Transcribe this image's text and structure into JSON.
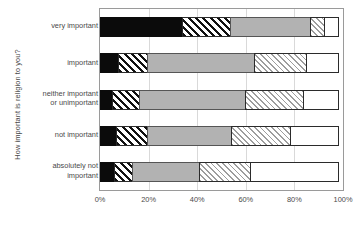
{
  "chart_data": {
    "type": "bar",
    "orientation": "horizontal",
    "stacked": "100%",
    "title": "",
    "xlabel": "",
    "ylabel": "How important is religion to you?",
    "xlim": [
      0,
      100
    ],
    "grid": true,
    "legend": "none",
    "xticks": [
      "0%",
      "20%",
      "40%",
      "60%",
      "80%",
      "100%"
    ],
    "xtick_values": [
      0,
      20,
      40,
      60,
      80,
      100
    ],
    "categories": [
      "very important",
      "important",
      "neither important or unimportant",
      "not important",
      "absolutely not important"
    ],
    "category_lines": [
      [
        "very important"
      ],
      [
        "important"
      ],
      [
        "neither important",
        "or unimportant"
      ],
      [
        "not important"
      ],
      [
        "absolutely not",
        "important"
      ]
    ],
    "series": [
      {
        "name": "series-1",
        "style": "solid-black",
        "color": "#0b0b0b",
        "values": [
          34.0,
          8.0,
          5.5,
          7.0,
          6.0
        ]
      },
      {
        "name": "series-2",
        "style": "dark-hatch",
        "color": "#111111",
        "values": [
          20.5,
          12.0,
          11.5,
          13.0,
          8.0
        ]
      },
      {
        "name": "series-3",
        "style": "solid-gray",
        "color": "#b2b2b2",
        "values": [
          33.0,
          44.5,
          44.0,
          35.0,
          28.0
        ]
      },
      {
        "name": "series-4",
        "style": "light-hatch",
        "color": "#9d9d9d",
        "values": [
          6.5,
          22.0,
          24.0,
          25.0,
          21.5
        ]
      },
      {
        "name": "series-5",
        "style": "solid-white",
        "color": "#ffffff",
        "values": [
          6.0,
          13.5,
          15.0,
          20.0,
          36.5
        ]
      }
    ]
  }
}
